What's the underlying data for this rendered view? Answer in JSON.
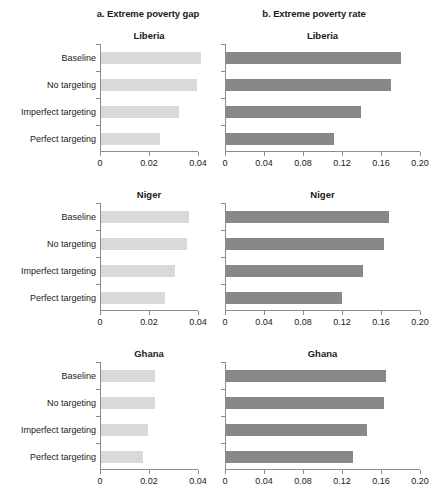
{
  "figure": {
    "panel_a_title": "a. Extreme poverty gap",
    "panel_b_title": "b. Extreme poverty rate",
    "countries": [
      "Liberia",
      "Niger",
      "Ghana"
    ],
    "categories": [
      "Baseline",
      "No targeting",
      "Imperfect targeting",
      "Perfect targeting"
    ],
    "colors": {
      "gap_bar": "#d9d9d9",
      "rate_bar": "#888888",
      "axis": "#8c8c8c",
      "text": "#1a1a1a"
    }
  },
  "chart_data": [
    {
      "type": "bar",
      "orientation": "horizontal",
      "title": "a. Extreme poverty gap",
      "subtitle": "Liberia",
      "categories": [
        "Baseline",
        "No targeting",
        "Imperfect targeting",
        "Perfect targeting"
      ],
      "values": [
        0.041,
        0.039,
        0.032,
        0.024
      ],
      "xlabel": "",
      "ylabel": "",
      "xlim": [
        0,
        0.04
      ],
      "xticks": [
        0,
        0.02,
        0.04
      ],
      "xticklabels": [
        "0",
        "0.02",
        "0.04"
      ],
      "color": "#d9d9d9",
      "grid": false,
      "legend": "none"
    },
    {
      "type": "bar",
      "orientation": "horizontal",
      "title": "b. Extreme poverty rate",
      "subtitle": "Liberia",
      "categories": [
        "Baseline",
        "No targeting",
        "Imperfect targeting",
        "Perfect targeting"
      ],
      "values": [
        0.179,
        0.169,
        0.138,
        0.111
      ],
      "xlabel": "",
      "ylabel": "",
      "xlim": [
        0,
        0.2
      ],
      "xticks": [
        0,
        0.04,
        0.08,
        0.12,
        0.16,
        0.2
      ],
      "xticklabels": [
        "0",
        "0.04",
        "0.08",
        "0.12",
        "0.16",
        "0.20"
      ],
      "color": "#888888",
      "grid": false,
      "legend": "none"
    },
    {
      "type": "bar",
      "orientation": "horizontal",
      "title": "",
      "subtitle": "Niger",
      "categories": [
        "Baseline",
        "No targeting",
        "Imperfect targeting",
        "Perfect targeting"
      ],
      "values": [
        0.036,
        0.035,
        0.03,
        0.026
      ],
      "xlabel": "",
      "ylabel": "",
      "xlim": [
        0,
        0.04
      ],
      "xticks": [
        0,
        0.02,
        0.04
      ],
      "xticklabels": [
        "0",
        "0.02",
        "0.04"
      ],
      "color": "#d9d9d9",
      "grid": false,
      "legend": "none"
    },
    {
      "type": "bar",
      "orientation": "horizontal",
      "title": "",
      "subtitle": "Niger",
      "categories": [
        "Baseline",
        "No targeting",
        "Imperfect targeting",
        "Perfect targeting"
      ],
      "values": [
        0.167,
        0.162,
        0.141,
        0.119
      ],
      "xlabel": "",
      "ylabel": "",
      "xlim": [
        0,
        0.2
      ],
      "xticks": [
        0,
        0.04,
        0.08,
        0.12,
        0.16,
        0.2
      ],
      "xticklabels": [
        "0",
        "0.04",
        "0.08",
        "0.12",
        "0.16",
        "0.20"
      ],
      "color": "#888888",
      "grid": false,
      "legend": "none"
    },
    {
      "type": "bar",
      "orientation": "horizontal",
      "title": "",
      "subtitle": "Ghana",
      "categories": [
        "Baseline",
        "No targeting",
        "Imperfect targeting",
        "Perfect targeting"
      ],
      "values": [
        0.022,
        0.022,
        0.019,
        0.017
      ],
      "xlabel": "",
      "ylabel": "",
      "xlim": [
        0,
        0.04
      ],
      "xticks": [
        0,
        0.02,
        0.04
      ],
      "xticklabels": [
        "0",
        "0.02",
        "0.04"
      ],
      "color": "#d9d9d9",
      "grid": false,
      "legend": "none"
    },
    {
      "type": "bar",
      "orientation": "horizontal",
      "title": "",
      "subtitle": "Ghana",
      "categories": [
        "Baseline",
        "No targeting",
        "Imperfect targeting",
        "Perfect targeting"
      ],
      "values": [
        0.164,
        0.162,
        0.145,
        0.13
      ],
      "xlabel": "",
      "ylabel": "",
      "xlim": [
        0,
        0.2
      ],
      "xticks": [
        0,
        0.04,
        0.08,
        0.12,
        0.16,
        0.2
      ],
      "xticklabels": [
        "0",
        "0.04",
        "0.08",
        "0.12",
        "0.16",
        "0.20"
      ],
      "color": "#888888",
      "grid": false,
      "legend": "none"
    }
  ]
}
